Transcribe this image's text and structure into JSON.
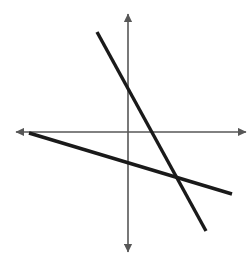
{
  "figure": {
    "title": "",
    "background_color": "#ffffff",
    "width": 252,
    "height": 262
  },
  "chart_data": {
    "type": "line",
    "title": "",
    "subtitle": "",
    "xlabel": "",
    "ylabel": "",
    "grid": false,
    "legend": null,
    "axes": {
      "origin": {
        "x": 128,
        "y": 132
      },
      "x_axis": {
        "name": "x-axis",
        "from": {
          "x": 16,
          "y": 132
        },
        "to": {
          "x": 246,
          "y": 132
        },
        "arrowheads": "both",
        "color": "#575757",
        "stroke_width": 1.6,
        "tick_labels": [],
        "range": null
      },
      "y_axis": {
        "name": "y-axis",
        "from": {
          "x": 128,
          "y": 14
        },
        "to": {
          "x": 128,
          "y": 252
        },
        "arrowheads": "both",
        "color": "#575757",
        "stroke_width": 1.6,
        "tick_labels": [],
        "range": null
      }
    },
    "series": [
      {
        "name": "steep-line",
        "label": "",
        "color": "#1a1a1a",
        "stroke_width": 3.4,
        "arrowheads": "none",
        "x": [
          97,
          206
        ],
        "y": [
          32,
          231
        ],
        "slope_screen": -1.83,
        "y_intercept_screen_y": 89,
        "x_intercept_screen_x": 151
      },
      {
        "name": "shallow-line",
        "label": "",
        "color": "#1a1a1a",
        "stroke_width": 3.4,
        "arrowheads": "none",
        "x": [
          29,
          232
        ],
        "y": [
          133,
          194
        ],
        "slope_screen": -0.3,
        "y_intercept_screen_y": 163,
        "x_intercept_screen_x": 26
      }
    ],
    "intersection_point": {
      "x": 178,
      "y": 180
    }
  }
}
